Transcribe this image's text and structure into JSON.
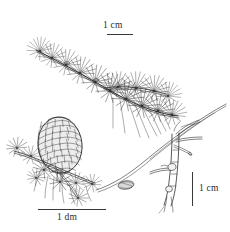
{
  "figure": {
    "type": "botanical-line-illustration",
    "background_color": "#ffffff",
    "ink_color": "#2b2b2b",
    "width": 230,
    "height": 232
  },
  "scales": {
    "top": {
      "label": "1 cm",
      "orientation": "horizontal",
      "bar_length_px": 26,
      "refers_to": "needled branch"
    },
    "bottom_left": {
      "label": "1 dm",
      "orientation": "horizontal",
      "bar_length_px": 68,
      "refers_to": "cone-bearing twig"
    },
    "right": {
      "label": "1 cm",
      "orientation": "vertical",
      "bar_length_px": 34,
      "refers_to": "winter twig and seed"
    }
  },
  "elements": [
    {
      "name": "needled-branch",
      "label": "leafy branch with needle fascicles",
      "position": "top"
    },
    {
      "name": "cone",
      "label": "mature ovoid cone on short shoot",
      "position": "lower-left"
    },
    {
      "name": "winter-twig",
      "label": "bare twig with short shoots and buds",
      "position": "right"
    },
    {
      "name": "seed",
      "label": "winged seed",
      "position": "center"
    },
    {
      "name": "long-needle",
      "label": "detached elongate needle",
      "position": "center"
    }
  ]
}
